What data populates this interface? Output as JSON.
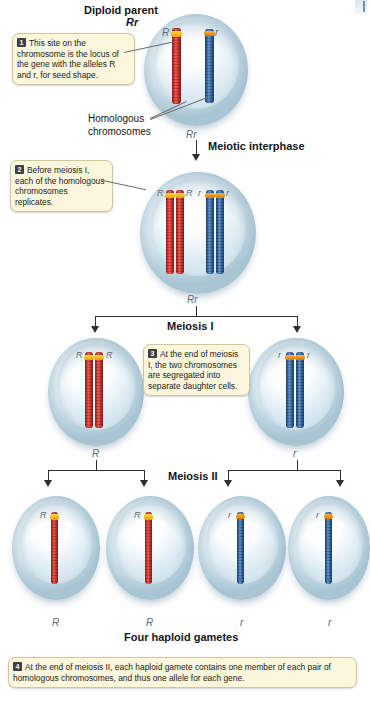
{
  "figure": {
    "title_top": "Diploid parent",
    "title_top_genotype": "Rr",
    "homologous_label_line1": "Homologous",
    "homologous_label_line2": "chromosomes",
    "interphase_genotype": "Rr",
    "interphase_label": "Meiotic interphase",
    "meiosis1_genotype": "Rr",
    "meiosis1_label": "Meiosis I",
    "meiosis2_label": "Meiosis II",
    "gametes_label": "Four haploid gametes"
  },
  "alleles": {
    "R": "R",
    "r": "r"
  },
  "parent_cell": {
    "chromosome_red_allele": "R",
    "chromosome_blue_allele": "r"
  },
  "interphase_cell": {
    "red_left_allele": "R",
    "red_right_allele": "R",
    "blue_left_allele": "r",
    "blue_right_allele": "r"
  },
  "meiosis1_cells": [
    {
      "left_allele": "R",
      "right_allele": "R",
      "below_label": "R"
    },
    {
      "left_allele": "r",
      "right_allele": "r",
      "below_label": "r"
    }
  ],
  "gametes": [
    {
      "allele": "R",
      "below_label": "R",
      "color": "red"
    },
    {
      "allele": "R",
      "below_label": "R",
      "color": "red"
    },
    {
      "allele": "r",
      "below_label": "r",
      "color": "blue"
    },
    {
      "allele": "r",
      "below_label": "r",
      "color": "blue"
    }
  ],
  "callouts": [
    {
      "number": "1",
      "text_parts": [
        "This site on the chromosome is the locus of the gene with the alleles ",
        "R",
        " and ",
        "r",
        ", for seed shape."
      ],
      "plain": "This site on the chromosome is the locus of the gene with the alleles R and r, for seed shape."
    },
    {
      "number": "2",
      "plain": "Before meiosis I, each of the homologous chromosomes replicates."
    },
    {
      "number": "3",
      "plain": "At the end of meiosis I, the two chromosomes are segregated into separate daughter cells."
    },
    {
      "number": "4",
      "plain": "At the end of meiosis II, each haploid gamete contains one member of each pair of homologous chromosomes, and thus one allele for each gene."
    }
  ],
  "colors": {
    "chromosome_red": "#c32a24",
    "chromosome_blue": "#2a5d99",
    "locus_band_red_chromosome": "#f2b316",
    "locus_band_blue_chromosome": "#f08a14",
    "callout_background": "#fbf6dc",
    "callout_border": "#cfc79c",
    "cell_fill": "#dbe9f0"
  }
}
